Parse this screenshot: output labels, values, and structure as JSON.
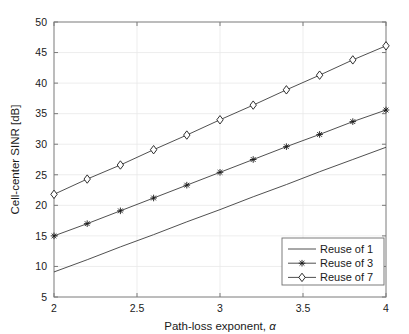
{
  "chart_data": {
    "type": "line",
    "title": "",
    "xlabel": "Path-loss exponent, α",
    "xlabel_text": "Path-loss exponent,",
    "xlabel_symbol": "α",
    "ylabel": "Cell-center SINR [dB]",
    "xlim": [
      2,
      4
    ],
    "ylim": [
      5,
      50
    ],
    "grid": true,
    "legend_position": "lower-right",
    "xticks": [
      2,
      2.5,
      3,
      3.5,
      4
    ],
    "xtick_labels": [
      "2",
      "2.5",
      "3",
      "3.5",
      "4"
    ],
    "yticks": [
      5,
      10,
      15,
      20,
      25,
      30,
      35,
      40,
      45,
      50
    ],
    "ytick_labels": [
      "5",
      "10",
      "15",
      "20",
      "25",
      "30",
      "35",
      "40",
      "45",
      "50"
    ],
    "x": [
      2.0,
      2.2,
      2.4,
      2.6,
      2.8,
      3.0,
      3.2,
      3.4,
      3.6,
      3.8,
      4.0
    ],
    "series": [
      {
        "name": "Reuse of 1",
        "marker": "none",
        "color": "#3c3c3c",
        "values": [
          9.1,
          11.1,
          13.2,
          15.2,
          17.3,
          19.3,
          21.4,
          23.4,
          25.5,
          27.5,
          29.5
        ]
      },
      {
        "name": "Reuse of 3",
        "marker": "asterisk",
        "color": "#3c3c3c",
        "values": [
          15.0,
          17.0,
          19.1,
          21.2,
          23.3,
          25.4,
          27.5,
          29.6,
          31.6,
          33.7,
          35.6
        ]
      },
      {
        "name": "Reuse of 7",
        "marker": "diamond",
        "color": "#3c3c3c",
        "values": [
          21.8,
          24.3,
          26.6,
          29.1,
          31.5,
          34.0,
          36.4,
          38.9,
          41.3,
          43.8,
          46.1
        ]
      }
    ]
  },
  "legend": {
    "entries": [
      {
        "label": "Reuse of 1",
        "marker": "none"
      },
      {
        "label": "Reuse of 3",
        "marker": "asterisk"
      },
      {
        "label": "Reuse of 7",
        "marker": "diamond"
      }
    ]
  },
  "colors": {
    "axis": "#7a7a7a",
    "grid": "#e8e8e8",
    "line": "#3c3c3c",
    "text": "#1a1a1a",
    "background": "#ffffff"
  }
}
